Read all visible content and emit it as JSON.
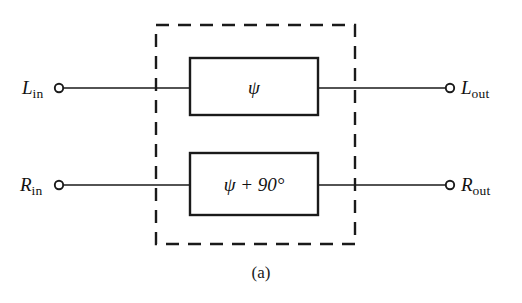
{
  "figure": {
    "caption": "(a)",
    "ink_color": "#1a1a1a",
    "background_color": "#ffffff"
  },
  "terminals": {
    "left_top": {
      "symbol": "L",
      "subscript": "in"
    },
    "left_bottom": {
      "symbol": "R",
      "subscript": "in"
    },
    "right_top": {
      "symbol": "L",
      "subscript": "out"
    },
    "right_bottom": {
      "symbol": "R",
      "subscript": "out"
    }
  },
  "blocks": {
    "top": {
      "label": "ψ"
    },
    "bottom": {
      "label": "ψ + 90°"
    }
  },
  "enclosure": {
    "style": "dashed"
  }
}
